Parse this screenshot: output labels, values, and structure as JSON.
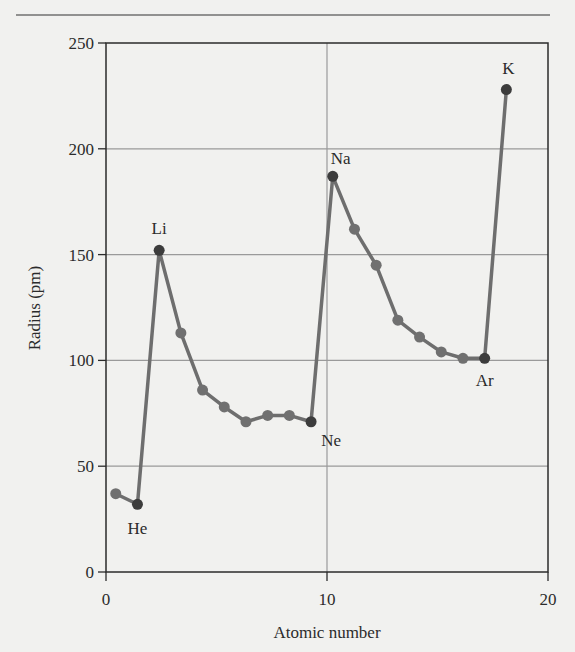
{
  "chart_data": {
    "type": "line",
    "title": "",
    "xlabel": "Atomic number",
    "ylabel": "Radius (pm)",
    "xlim": [
      0,
      20
    ],
    "ylim": [
      0,
      250
    ],
    "xticks": [
      0,
      10,
      20
    ],
    "yticks": [
      0,
      50,
      100,
      150,
      200,
      250
    ],
    "grid": true,
    "legend": null,
    "series": [
      {
        "name": "Atomic radius",
        "x": [
          1,
          2,
          3,
          4,
          5,
          6,
          7,
          8,
          9,
          10,
          11,
          12,
          13,
          14,
          15,
          16,
          17,
          18,
          19
        ],
        "elements": [
          "H",
          "He",
          "Li",
          "Be",
          "B",
          "C",
          "N",
          "O",
          "F",
          "Ne",
          "Na",
          "Mg",
          "Al",
          "Si",
          "P",
          "S",
          "Cl",
          "Ar",
          "K"
        ],
        "values": [
          37,
          32,
          152,
          113,
          86,
          78,
          71,
          74,
          74,
          71,
          187,
          162,
          145,
          119,
          111,
          104,
          101,
          101,
          228
        ]
      }
    ],
    "annotations": [
      {
        "text": "He",
        "element_index": 1
      },
      {
        "text": "Li",
        "element_index": 2
      },
      {
        "text": "Ne",
        "element_index": 9
      },
      {
        "text": "Na",
        "element_index": 10
      },
      {
        "text": "Ar",
        "element_index": 17
      },
      {
        "text": "K",
        "element_index": 18
      }
    ]
  },
  "colors": {
    "background": "#f1f1ef",
    "line": "#6e6e6e",
    "marker": "#707070",
    "marker_highlight": "#3c3c3c",
    "grid": "#9a9a9a",
    "axis": "#2b2b2b"
  }
}
